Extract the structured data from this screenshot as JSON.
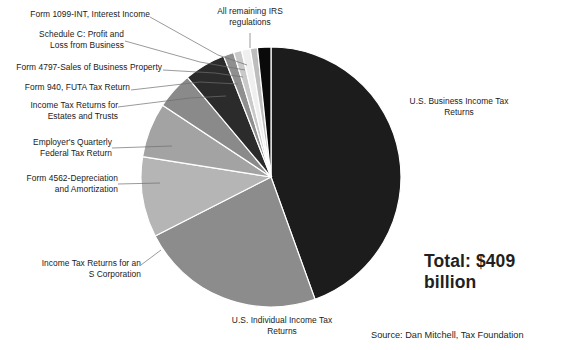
{
  "chart_data": {
    "type": "pie",
    "title": "",
    "total_label": "Total: $409 billion",
    "source": "Source: Dan Mitchell, Tax Foundation",
    "units": "billions of dollars (compliance cost)",
    "legend_position": "callout-labels",
    "center": {
      "x": 271,
      "y": 177
    },
    "radius": 130,
    "start_angle_deg": 0,
    "direction": "clockwise",
    "categories": [
      "U.S. Business Income Tax Returns",
      "U.S. Individual Income Tax Returns",
      "Income Tax Returns for an S Corporation",
      "Form 4562-Depreciation and Amortization",
      "Employer's Quarterly Federal Tax Return",
      "Income Tax Returns for Estates and Trusts",
      "Form 940, FUTA Tax Return",
      "Form 4797-Sales of Business Property",
      "Schedule C: Profit and Loss from Business",
      "Form 1099-INT, Interest Income",
      "All remaining IRS regulations"
    ],
    "values": [
      44.5,
      23.0,
      10.0,
      6.8,
      4.6,
      5.2,
      1.3,
      1.0,
      1.1,
      0.9,
      1.6
    ],
    "value_unit": "percent",
    "colors": [
      "#1c1c1c",
      "#8c8c8c",
      "#b5b5b5",
      "#a3a3a3",
      "#8a8a8a",
      "#2b2b2b",
      "#8f8f8f",
      "#c9c9c9",
      "#efefef",
      "#bdbdbd",
      "#0a0a0a"
    ],
    "slices": [
      {
        "label": "U.S. Business Income Tax Returns",
        "start": 0,
        "end": 160.2,
        "color": "#1c1c1c"
      },
      {
        "label": "U.S. Individual Income Tax Returns",
        "start": 160.2,
        "end": 243.0,
        "color": "#8c8c8c"
      },
      {
        "label": "Income Tax Returns for an S Corporation",
        "start": 243.0,
        "end": 279.0,
        "color": "#b5b5b5"
      },
      {
        "label": "Form 4562-Depreciation and Amortization",
        "start": 279.0,
        "end": 303.5,
        "color": "#a3a3a3"
      },
      {
        "label": "Employer's Quarterly Federal Tax Return",
        "start": 303.5,
        "end": 320.0,
        "color": "#8a8a8a"
      },
      {
        "label": "Income Tax Returns for Estates and Trusts",
        "start": 320.0,
        "end": 338.6,
        "color": "#2b2b2b"
      },
      {
        "label": "Form 940, FUTA Tax Return",
        "start": 338.6,
        "end": 343.3,
        "color": "#8f8f8f"
      },
      {
        "label": "Form 4797-Sales of Business Property",
        "start": 343.3,
        "end": 346.9,
        "color": "#c9c9c9"
      },
      {
        "label": "Schedule C: Profit and Loss from Business",
        "start": 346.9,
        "end": 350.8,
        "color": "#efefef"
      },
      {
        "label": "Form 1099-INT, Interest Income",
        "start": 350.8,
        "end": 354.0,
        "color": "#bdbdbd"
      },
      {
        "label": "All remaining IRS regulations",
        "start": 354.0,
        "end": 360.0,
        "color": "#0a0a0a"
      }
    ]
  },
  "labels": {
    "form_1099_int": "Form 1099-INT, Interest Income",
    "schedule_c": "Schedule C: Profit and\nLoss from Business",
    "form_4797": "Form 4797-Sales of Business Property",
    "form_940": "Form 940, FUTA Tax Return",
    "estates_trusts": "Income Tax Returns for\nEstates and Trusts",
    "employers_quarterly": "Employer's Quarterly\nFederal Tax Return",
    "form_4562": "Form 4562-Depreciation\nand Amortization",
    "s_corporation": "Income Tax Returns for an\nS Corporation",
    "all_remaining": "All remaining IRS\nregulations",
    "business_returns": "U.S. Business Income Tax\nReturns",
    "individual_returns": "U.S. Individual Income Tax\nReturns"
  },
  "annotations": {
    "total": "Total: $409\nbillion",
    "source": "Source: Dan Mitchell, Tax Foundation"
  }
}
